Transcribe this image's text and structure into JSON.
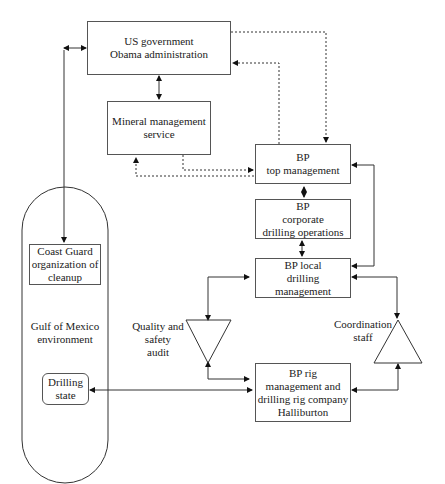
{
  "nodes": {
    "us_gov": {
      "lines": [
        "US government",
        "Obama administration"
      ]
    },
    "mms": {
      "lines": [
        "Mineral management",
        "service"
      ]
    },
    "bp_top": {
      "lines": [
        "BP",
        "top management"
      ]
    },
    "bp_corp": {
      "lines": [
        "BP",
        "corporate",
        "drilling operations"
      ]
    },
    "bp_local": {
      "lines": [
        "BP local",
        "drilling",
        "management"
      ]
    },
    "bp_rig": {
      "lines": [
        "BP rig",
        "management and",
        "drilling rig company",
        "Halliburton"
      ]
    },
    "coast_guard": {
      "lines": [
        "Coast Guard",
        "organization of",
        "cleanup"
      ]
    },
    "gulf": {
      "lines": [
        "Gulf of Mexico",
        "environment"
      ]
    },
    "drilling_state": {
      "lines": [
        "Drilling",
        "state"
      ]
    },
    "qa": {
      "lines": [
        "Quality and",
        "safety",
        "audit"
      ]
    },
    "coord": {
      "lines": [
        "Coordination",
        "staff"
      ]
    }
  },
  "edges": [
    {
      "from": "us_gov",
      "to": "mms",
      "style": "solid",
      "dir": "both"
    },
    {
      "from": "us_gov",
      "to": "bp_top",
      "style": "dotted",
      "dir": "forward"
    },
    {
      "from": "bp_top",
      "to": "us_gov",
      "style": "dotted",
      "dir": "forward"
    },
    {
      "from": "mms",
      "to": "bp_top",
      "style": "dotted",
      "dir": "forward"
    },
    {
      "from": "bp_top",
      "to": "mms",
      "style": "dotted",
      "dir": "forward"
    },
    {
      "from": "bp_top",
      "to": "bp_corp",
      "style": "solid",
      "dir": "both"
    },
    {
      "from": "bp_corp",
      "to": "bp_local",
      "style": "solid",
      "dir": "both"
    },
    {
      "from": "bp_top",
      "to": "bp_local",
      "style": "solid",
      "dir": "both"
    },
    {
      "from": "us_gov",
      "to": "coast_guard",
      "style": "solid",
      "dir": "both"
    },
    {
      "from": "bp_local",
      "to": "qa",
      "style": "solid",
      "dir": "both"
    },
    {
      "from": "qa",
      "to": "bp_rig",
      "style": "solid",
      "dir": "both"
    },
    {
      "from": "bp_local",
      "to": "coord",
      "style": "solid",
      "dir": "both"
    },
    {
      "from": "coord",
      "to": "bp_rig",
      "style": "solid",
      "dir": "both"
    },
    {
      "from": "drilling_state",
      "to": "bp_rig",
      "style": "solid",
      "dir": "both"
    }
  ]
}
